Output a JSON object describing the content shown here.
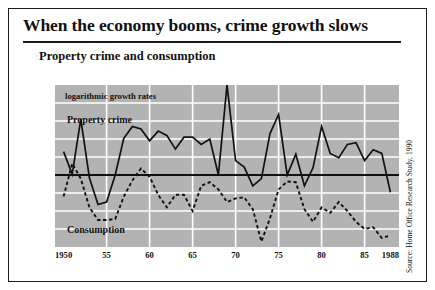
{
  "title": "When the economy booms, crime growth slows",
  "subtitle": "Property crime and consumption",
  "annotations": {
    "units": "logarithmic growth rates",
    "series_a": "Property crime",
    "series_b": "Consumption"
  },
  "source": "Source: Home Office Research Study, 1990",
  "chart_data": {
    "type": "line",
    "title": "Property crime and consumption",
    "subtitle": "logarithmic growth rates",
    "xlabel": "",
    "ylabel": "",
    "xlim": [
      1949,
      1989
    ],
    "ylim": [
      -0.2,
      0.25
    ],
    "grid": true,
    "legend_position": "in-plot-annotation",
    "plot_background": "#b3b3b3",
    "gridline_color": "#ffffff",
    "zero_line": 0.0,
    "ytick_labels": [
      "0.25",
      "0.20",
      "0.15",
      "0.10",
      "0.05",
      "0.00",
      "-0.05",
      "-0.10",
      "-0.15",
      "-0.20"
    ],
    "ytick_values": [
      0.25,
      0.2,
      0.15,
      0.1,
      0.05,
      0.0,
      -0.05,
      -0.1,
      -0.15,
      -0.2
    ],
    "xtick_labels": [
      "1950",
      "55",
      "60",
      "65",
      "70",
      "75",
      "80",
      "85",
      "1988"
    ],
    "xtick_values": [
      1950,
      1955,
      1960,
      1965,
      1970,
      1975,
      1980,
      1985,
      1988
    ],
    "x": [
      1950,
      1951,
      1952,
      1953,
      1954,
      1955,
      1956,
      1957,
      1958,
      1959,
      1960,
      1961,
      1962,
      1963,
      1964,
      1965,
      1966,
      1967,
      1968,
      1969,
      1970,
      1971,
      1972,
      1973,
      1974,
      1975,
      1976,
      1977,
      1978,
      1979,
      1980,
      1981,
      1982,
      1983,
      1984,
      1985,
      1986,
      1987,
      1988
    ],
    "series": [
      {
        "name": "Property crime",
        "style": "solid",
        "color": "#111111",
        "values": [
          0.065,
          0.002,
          0.155,
          -0.008,
          -0.082,
          -0.075,
          0.0,
          0.102,
          0.135,
          0.128,
          0.095,
          0.122,
          0.11,
          0.072,
          0.105,
          0.105,
          0.085,
          0.1,
          0.0,
          0.25,
          0.04,
          0.022,
          -0.03,
          -0.01,
          0.115,
          0.168,
          0.0,
          0.058,
          -0.03,
          0.02,
          0.135,
          0.06,
          0.048,
          0.085,
          0.09,
          0.04,
          0.07,
          0.06,
          -0.048
        ]
      },
      {
        "name": "Consumption",
        "style": "dashed",
        "color": "#111111",
        "values": [
          -0.06,
          0.032,
          -0.01,
          -0.09,
          -0.125,
          -0.125,
          -0.122,
          -0.06,
          -0.015,
          0.018,
          -0.005,
          -0.055,
          -0.09,
          -0.055,
          -0.055,
          -0.1,
          -0.03,
          -0.02,
          -0.04,
          -0.075,
          -0.065,
          -0.062,
          -0.095,
          -0.185,
          -0.12,
          -0.04,
          -0.018,
          -0.02,
          -0.095,
          -0.13,
          -0.09,
          -0.105,
          -0.075,
          -0.1,
          -0.13,
          -0.15,
          -0.145,
          -0.175,
          -0.168
        ]
      }
    ]
  }
}
